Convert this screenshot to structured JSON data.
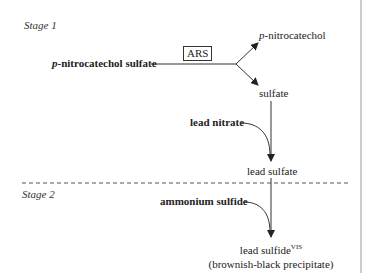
{
  "diagram": {
    "stage1": {
      "label": "Stage 1"
    },
    "stage2": {
      "label": "Stage 2"
    },
    "substrate": {
      "prefix": "p",
      "rest": "-nitrocatechol sulfate"
    },
    "enzyme": "ARS",
    "product1": {
      "prefix": "p",
      "rest": "-nitrocatechol"
    },
    "product2": "sulfate",
    "reagent1": "lead nitrate",
    "intermediate": "lead sulfate",
    "reagent2": "ammonium sulfide",
    "final": {
      "name": "lead sulfide",
      "superscript": "VIS",
      "note": "(brownish-black precipitate)"
    },
    "colors": {
      "line": "#333333",
      "dash": "#555555",
      "border": "#999999"
    }
  }
}
